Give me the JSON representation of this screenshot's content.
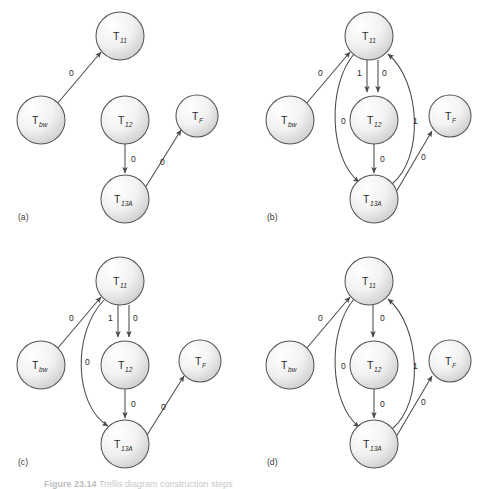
{
  "figure": {
    "width": 497,
    "height": 489,
    "caption_prefix": "Figure 23.14",
    "caption_rest": "Trellis diagram construction steps",
    "background": "#ffffff",
    "node_stroke": "#555555",
    "edge_stroke": "#4a4a4a",
    "node_fill_light": "#fdfdfd",
    "node_fill_dark": "#d2d2d2",
    "text_color": "#2b2b2b"
  },
  "nodes": {
    "t11": {
      "base": "T",
      "sub": "11",
      "cx": 120,
      "cy": 36,
      "r": 24
    },
    "tbw": {
      "base": "T",
      "sub": "bw",
      "cx": 41,
      "cy": 120,
      "r": 24
    },
    "t12": {
      "base": "T",
      "sub": "12",
      "cx": 125,
      "cy": 120,
      "r": 24
    },
    "tf": {
      "base": "T",
      "sub": "F",
      "cx": 197,
      "cy": 116,
      "r": 21
    },
    "t13a": {
      "base": "T",
      "sub": "13A",
      "cx": 125,
      "cy": 199,
      "r": 24
    }
  },
  "panels": [
    {
      "id": "a",
      "tag": "(a)",
      "tag_x": 18,
      "tag_y": 220,
      "edges": [
        {
          "name": "tbw-to-t11",
          "label": "0",
          "label_x": 69,
          "label_y": 76,
          "from": "tbw",
          "to": "t11"
        },
        {
          "name": "t12-to-t13a",
          "label": "0",
          "label_x": 131,
          "label_y": 162,
          "from": "t12",
          "to": "t13a"
        },
        {
          "name": "t13a-to-tf",
          "label": "0",
          "label_x": 160,
          "label_y": 165,
          "from": "t13a",
          "to": "tf"
        }
      ]
    },
    {
      "id": "b",
      "tag": "(b)",
      "tag_x": 18,
      "tag_y": 220,
      "edges": [
        {
          "name": "tbw-to-t11",
          "label": "0",
          "label_x": 69,
          "label_y": 76,
          "from": "tbw",
          "to": "t11"
        },
        {
          "name": "t11-to-t12-left",
          "label": "1",
          "label_x": 111,
          "label_y": 75,
          "from": "t11",
          "to": "t12"
        },
        {
          "name": "t11-to-t12-right",
          "label": "0",
          "label_x": 133,
          "label_y": 75,
          "from": "t11",
          "to": "t12"
        },
        {
          "name": "t11-to-t13a-curve",
          "label": "0",
          "label_x": 93,
          "label_y": 124,
          "from": "t11",
          "to": "t13a"
        },
        {
          "name": "t13a-to-t11-curve",
          "label": "1",
          "label_x": 164,
          "label_y": 124,
          "from": "t13a",
          "to": "t11"
        },
        {
          "name": "t12-to-t13a",
          "label": "0",
          "label_x": 131,
          "label_y": 162,
          "from": "t12",
          "to": "t13a"
        },
        {
          "name": "t13a-to-tf",
          "label": "0",
          "label_x": 171,
          "label_y": 160,
          "from": "t13a",
          "to": "tf"
        }
      ]
    },
    {
      "id": "c",
      "tag": "(c)",
      "tag_x": 18,
      "tag_y": 220,
      "edges": [
        {
          "name": "tbw-to-t11",
          "label": "0",
          "label_x": 69,
          "label_y": 76,
          "from": "tbw",
          "to": "t11"
        },
        {
          "name": "t11-to-t12-left",
          "label": "1",
          "label_x": 111,
          "label_y": 75,
          "from": "t11",
          "to": "t12"
        },
        {
          "name": "t11-to-t12-right",
          "label": "0",
          "label_x": 133,
          "label_y": 75,
          "from": "t11",
          "to": "t12"
        },
        {
          "name": "t11-to-t13a-curve",
          "label": "0",
          "label_x": 86,
          "label_y": 120,
          "from": "t11",
          "to": "t13a"
        },
        {
          "name": "t12-to-t13a",
          "label": "0",
          "label_x": 131,
          "label_y": 162,
          "from": "t12",
          "to": "t13a"
        },
        {
          "name": "t13a-to-tf",
          "label": "0",
          "label_x": 160,
          "label_y": 165,
          "from": "t13a",
          "to": "tf"
        }
      ]
    },
    {
      "id": "d",
      "tag": "(d)",
      "tag_x": 18,
      "tag_y": 220,
      "edges": [
        {
          "name": "tbw-to-t11",
          "label": "0",
          "label_x": 69,
          "label_y": 76,
          "from": "tbw",
          "to": "t11"
        },
        {
          "name": "t11-to-t12",
          "label": "0",
          "label_x": 133,
          "label_y": 75,
          "from": "t11",
          "to": "t12"
        },
        {
          "name": "t11-to-t13a-curve",
          "label": "0",
          "label_x": 93,
          "label_y": 124,
          "from": "t11",
          "to": "t13a"
        },
        {
          "name": "t13a-to-t11-curve",
          "label": "1",
          "label_x": 164,
          "label_y": 124,
          "from": "t13a",
          "to": "t11"
        },
        {
          "name": "t12-to-t13a",
          "label": "0",
          "label_x": 131,
          "label_y": 162,
          "from": "t12",
          "to": "t13a"
        },
        {
          "name": "t13a-to-tf",
          "label": "0",
          "label_x": 171,
          "label_y": 160,
          "from": "t13a",
          "to": "tf"
        }
      ]
    }
  ]
}
